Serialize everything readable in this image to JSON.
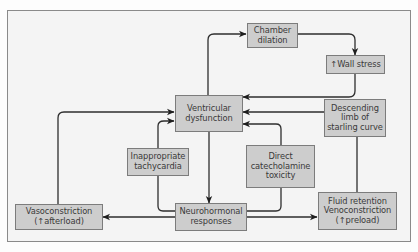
{
  "diagram": {
    "boxes": {
      "chamber_dilation": {
        "lines": [
          "Chamber",
          "dilation"
        ]
      },
      "wall_stress": {
        "lines": [
          "↑Wall stress"
        ]
      },
      "ventricular_dysfunction": {
        "lines": [
          "Ventricular",
          "dysfunction"
        ]
      },
      "descending_limb": {
        "lines": [
          "Descending",
          "limb of",
          "starling curve"
        ]
      },
      "inappropriate_tachycardia": {
        "lines": [
          "Inappropriate",
          "tachycardia"
        ]
      },
      "catecholamine_toxicity": {
        "lines": [
          "Direct",
          "catecholamine",
          "toxicity"
        ]
      },
      "vasoconstriction": {
        "lines": [
          "Vasoconstriction",
          "(↑afterload)"
        ]
      },
      "neurohormonal_responses": {
        "lines": [
          "Neurohormonal",
          "responses"
        ]
      },
      "fluid_retention": {
        "lines": [
          "Fluid retention",
          "Venoconstriction",
          "(↑preload)"
        ]
      }
    },
    "edges": [
      {
        "from": "ventricular_dysfunction",
        "to": "chamber_dilation"
      },
      {
        "from": "chamber_dilation",
        "to": "wall_stress"
      },
      {
        "from": "wall_stress",
        "to": "ventricular_dysfunction"
      },
      {
        "from": "descending_limb",
        "to": "ventricular_dysfunction"
      },
      {
        "from": "ventricular_dysfunction",
        "to": "neurohormonal_responses"
      },
      {
        "from": "neurohormonal_responses",
        "to": "vasoconstriction"
      },
      {
        "from": "neurohormonal_responses",
        "to": "fluid_retention"
      },
      {
        "from": "vasoconstriction",
        "to": "ventricular_dysfunction"
      },
      {
        "from": "neurohormonal_responses",
        "to": "ventricular_dysfunction",
        "via": "inappropriate_tachycardia"
      },
      {
        "from": "neurohormonal_responses",
        "to": "ventricular_dysfunction",
        "via": "catecholamine_toxicity"
      },
      {
        "from": "fluid_retention",
        "to": "descending_limb"
      }
    ],
    "colors": {
      "box_fill": "#cdcdcd",
      "box_border": "#7c7c7c",
      "frame_fill": "#f4f4f4",
      "line": "#2a2a2a"
    }
  }
}
